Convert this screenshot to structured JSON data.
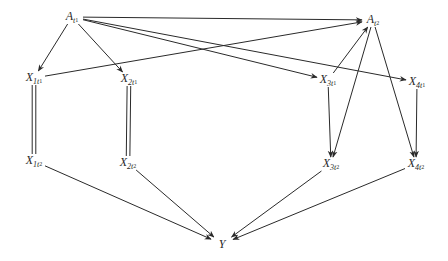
{
  "diagram": {
    "type": "causal-graph",
    "nodes": [
      {
        "id": "A_t1",
        "main": "A",
        "sub": "t",
        "subsub": "1",
        "x": 72,
        "y": 17
      },
      {
        "id": "A_t2",
        "main": "A",
        "sub": "t",
        "subsub": "2",
        "x": 373,
        "y": 20
      },
      {
        "id": "X_1t1",
        "main": "X",
        "sub": "1t",
        "subsub": "1",
        "x": 34,
        "y": 78
      },
      {
        "id": "X_2t1",
        "main": "X",
        "sub": "2t",
        "subsub": "1",
        "x": 129,
        "y": 79
      },
      {
        "id": "X_3t1",
        "main": "X",
        "sub": "3t",
        "subsub": "1",
        "x": 328,
        "y": 80
      },
      {
        "id": "X_4t1",
        "main": "X",
        "sub": "4t",
        "subsub": "1",
        "x": 417,
        "y": 82
      },
      {
        "id": "X_1t2",
        "main": "X",
        "sub": "1t",
        "subsub": "2",
        "x": 34,
        "y": 161
      },
      {
        "id": "X_2t2",
        "main": "X",
        "sub": "2t",
        "subsub": "2",
        "x": 128,
        "y": 163
      },
      {
        "id": "X_3t2",
        "main": "X",
        "sub": "3t",
        "subsub": "2",
        "x": 331,
        "y": 164
      },
      {
        "id": "X_4t2",
        "main": "X",
        "sub": "4t",
        "subsub": "2",
        "x": 416,
        "y": 164
      },
      {
        "id": "Y",
        "main": "Y",
        "sub": "",
        "subsub": "",
        "x": 222,
        "y": 244
      }
    ],
    "edges": [
      {
        "from": "A_t1",
        "to": "X_1t1",
        "style": "arrow"
      },
      {
        "from": "A_t1",
        "to": "X_2t1",
        "style": "arrow"
      },
      {
        "from": "A_t1",
        "to": "A_t2",
        "style": "arrow"
      },
      {
        "from": "A_t1",
        "to": "X_3t1",
        "style": "arrow"
      },
      {
        "from": "A_t1",
        "to": "X_4t1",
        "style": "arrow"
      },
      {
        "from": "X_1t1",
        "to": "A_t2",
        "style": "arrow"
      },
      {
        "from": "X_3t1",
        "to": "A_t2",
        "style": "arrow"
      },
      {
        "from": "A_t2",
        "to": "X_3t2",
        "style": "arrow"
      },
      {
        "from": "A_t2",
        "to": "X_4t2",
        "style": "arrow"
      },
      {
        "from": "X_1t1",
        "to": "X_1t2",
        "style": "double"
      },
      {
        "from": "X_2t1",
        "to": "X_2t2",
        "style": "double"
      },
      {
        "from": "X_3t1",
        "to": "X_3t2",
        "style": "arrow"
      },
      {
        "from": "X_4t1",
        "to": "X_4t2",
        "style": "arrow"
      },
      {
        "from": "X_1t2",
        "to": "Y",
        "style": "arrow"
      },
      {
        "from": "X_2t2",
        "to": "Y",
        "style": "arrow"
      },
      {
        "from": "X_3t2",
        "to": "Y",
        "style": "arrow"
      },
      {
        "from": "X_4t2",
        "to": "Y",
        "style": "arrow"
      }
    ]
  }
}
